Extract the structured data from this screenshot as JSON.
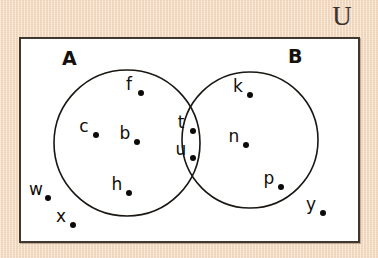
{
  "diagram": {
    "title_symbol": "∪",
    "universe_label": "U",
    "sets": [
      {
        "id": "A",
        "label": "A",
        "cx": 127,
        "cy": 143,
        "r": 73
      },
      {
        "id": "B",
        "label": "B",
        "cx": 250,
        "cy": 140,
        "r": 68
      }
    ],
    "regions": {
      "a_only": [
        "f",
        "c",
        "b",
        "h"
      ],
      "intersection": [
        "t",
        "u"
      ],
      "b_only": [
        "k",
        "n",
        "p"
      ],
      "outside": [
        "w",
        "x",
        "y"
      ]
    },
    "elements": [
      {
        "label": "f",
        "x": 129,
        "y": 88,
        "region": "a_only"
      },
      {
        "label": "c",
        "x": 84,
        "y": 130,
        "region": "a_only"
      },
      {
        "label": "b",
        "x": 125,
        "y": 137,
        "region": "a_only"
      },
      {
        "label": "h",
        "x": 117,
        "y": 188,
        "region": "a_only"
      },
      {
        "label": "t",
        "x": 181,
        "y": 126,
        "region": "intersection"
      },
      {
        "label": "u",
        "x": 181,
        "y": 153,
        "region": "intersection"
      },
      {
        "label": "k",
        "x": 238,
        "y": 90,
        "region": "b_only"
      },
      {
        "label": "n",
        "x": 234,
        "y": 140,
        "region": "b_only"
      },
      {
        "label": "p",
        "x": 269,
        "y": 182,
        "region": "b_only"
      },
      {
        "label": "w",
        "x": 36,
        "y": 193,
        "region": "outside"
      },
      {
        "label": "x",
        "x": 61,
        "y": 220,
        "region": "outside"
      },
      {
        "label": "y",
        "x": 311,
        "y": 208,
        "region": "outside"
      }
    ],
    "colors": {
      "background": "#f6ddc4",
      "box_fill": "#ffffff",
      "box_border": "#40382f",
      "circle_stroke": "#1a1713",
      "text": "#100d0a"
    }
  }
}
